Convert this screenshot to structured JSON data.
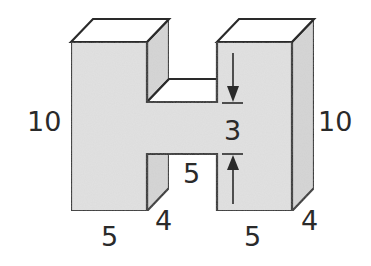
{
  "diagram": {
    "colors": {
      "face": "#e0e0e0",
      "side": "#d4d4d4",
      "top": "#ffffff",
      "stroke": "#2a2a2a"
    },
    "labels": {
      "left_height": "10",
      "right_height": "10",
      "crossbar_height": "3",
      "gap_width": "5",
      "left_base": "5",
      "right_base": "5",
      "left_depth": "4",
      "right_depth": "4"
    }
  }
}
